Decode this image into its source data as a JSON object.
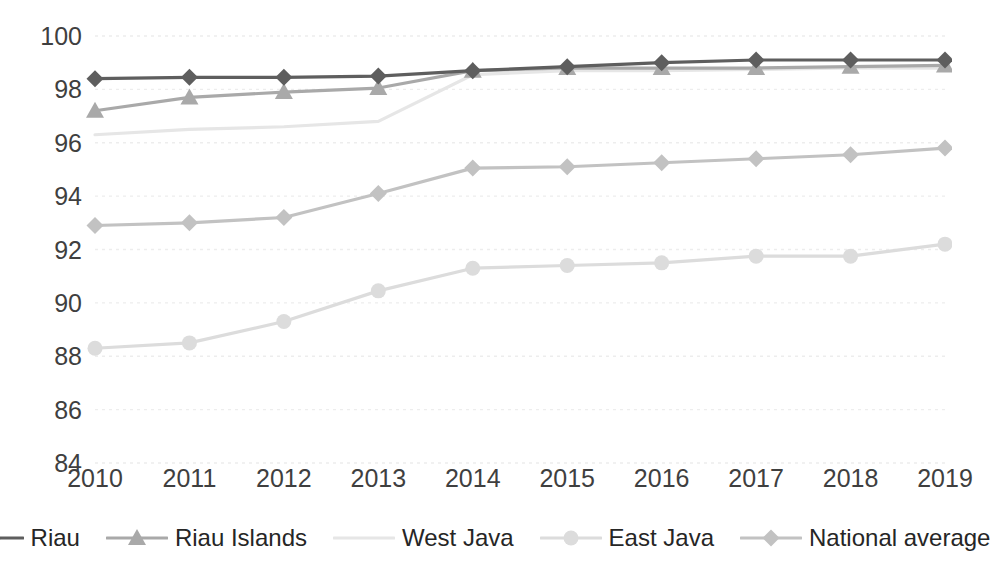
{
  "chart_data": {
    "type": "line",
    "title": "",
    "subtitle": "",
    "xlabel": "",
    "ylabel": "",
    "categories": [
      "2010",
      "2011",
      "2012",
      "2013",
      "2014",
      "2015",
      "2016",
      "2017",
      "2018",
      "2019"
    ],
    "x": [
      2010,
      2011,
      2012,
      2013,
      2014,
      2015,
      2016,
      2017,
      2018,
      2019
    ],
    "ylim": [
      84,
      100
    ],
    "yticks": [
      84,
      86,
      88,
      90,
      92,
      94,
      96,
      98,
      100
    ],
    "ytick_labels": [
      "84",
      "86",
      "88",
      "90",
      "92",
      "94",
      "96",
      "98",
      "100"
    ],
    "xlim": [
      2010,
      2019
    ],
    "grid": "horizontal-dotted",
    "legend_position": "bottom",
    "series": [
      {
        "name": "Riau",
        "color": "#5e5e5e",
        "marker": "diamond",
        "values": [
          98.4,
          98.45,
          98.45,
          98.5,
          98.7,
          98.85,
          99.0,
          99.1,
          99.1,
          99.1
        ]
      },
      {
        "name": "Riau Islands",
        "color": "#a9a9a9",
        "marker": "triangle",
        "values": [
          97.2,
          97.7,
          97.9,
          98.05,
          98.7,
          98.8,
          98.8,
          98.8,
          98.85,
          98.9
        ]
      },
      {
        "name": "West Java",
        "color": "#e6e6e6",
        "marker": "none",
        "values": [
          96.3,
          96.5,
          96.6,
          96.8,
          98.55,
          98.7,
          98.7,
          98.75,
          98.8,
          98.8
        ]
      },
      {
        "name": "East Java",
        "color": "#dcdcdc",
        "marker": "circle",
        "values": [
          88.3,
          88.5,
          89.3,
          90.45,
          91.3,
          91.4,
          91.5,
          91.75,
          91.75,
          92.2
        ]
      },
      {
        "name": "National average",
        "color": "#c2c2c2",
        "marker": "diamond",
        "values": [
          92.9,
          93.0,
          93.2,
          94.1,
          95.05,
          95.1,
          95.25,
          95.4,
          95.55,
          95.8
        ]
      }
    ]
  },
  "legend": {
    "items": [
      {
        "label": "Riau"
      },
      {
        "label": "Riau Islands"
      },
      {
        "label": "West Java"
      },
      {
        "label": "East Java"
      },
      {
        "label": "National average"
      }
    ]
  },
  "style": {
    "background": "#ffffff",
    "gridline_color": "#ededed",
    "tick_label_color": "#3f3f3f",
    "legend_label_color": "#262626"
  }
}
